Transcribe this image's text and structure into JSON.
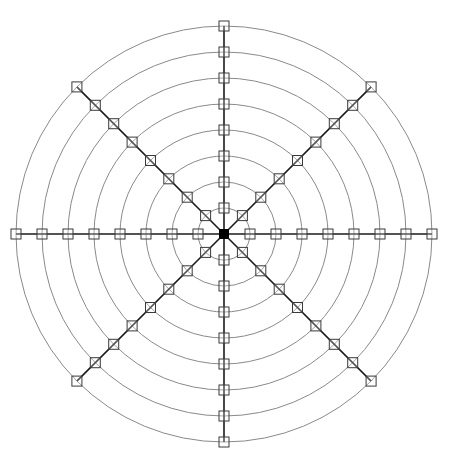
{
  "diagram": {
    "type": "polar-grid",
    "center": {
      "x": 224,
      "y": 234
    },
    "ring_count": 8,
    "ring_radii": [
      26,
      52,
      78,
      104,
      130,
      156,
      182,
      208
    ],
    "spoke_angles_deg": [
      0,
      45,
      90,
      135,
      180,
      225,
      270,
      315
    ],
    "marker_size": 10,
    "hub_size": 10,
    "colors": {
      "background": "#ffffff",
      "ring": "#8a8a8a",
      "spoke": "#1a1a1a",
      "marker_stroke": "#3a3a3a",
      "hub": "#000000"
    }
  }
}
